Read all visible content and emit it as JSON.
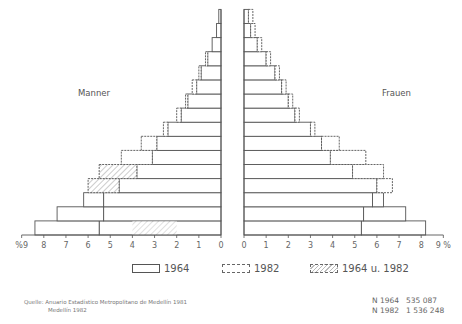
{
  "chart_data": {
    "type": "bar",
    "subtype": "population-pyramid",
    "title": "",
    "left_label": "Manner",
    "right_label": "Frauen",
    "xlabel": "%",
    "xlim": [
      0,
      9
    ],
    "x_ticks_left": [
      "%9",
      "8",
      "7",
      "6",
      "5",
      "4",
      "3",
      "2",
      "1",
      "0"
    ],
    "x_ticks_right": [
      "0",
      "1",
      "2",
      "3",
      "4",
      "5",
      "6",
      "7",
      "8",
      "9 %"
    ],
    "rows_bottom_to_top": 16,
    "series": [
      {
        "name": "1964 Manner",
        "side": "left",
        "values": [
          8.4,
          7.4,
          6.2,
          4.6,
          3.8,
          3.1,
          2.9,
          2.4,
          1.8,
          1.5,
          1.1,
          0.9,
          0.6,
          0.4,
          0.2,
          0.1
        ]
      },
      {
        "name": "1982 Manner",
        "side": "left",
        "values": [
          5.5,
          5.3,
          5.3,
          6.0,
          5.5,
          4.5,
          3.6,
          2.6,
          2.0,
          1.6,
          1.3,
          1.0,
          0.7,
          0.4,
          0.2,
          0.1
        ]
      },
      {
        "name": "1964 Frauen",
        "side": "right",
        "values": [
          8.2,
          7.3,
          6.3,
          6.0,
          4.9,
          3.9,
          3.5,
          3.0,
          2.3,
          2.0,
          1.7,
          1.4,
          1.0,
          0.6,
          0.3,
          0.2
        ]
      },
      {
        "name": "1982 Frauen",
        "side": "right",
        "values": [
          5.3,
          5.4,
          5.8,
          6.7,
          6.3,
          5.5,
          4.3,
          3.2,
          2.5,
          2.2,
          1.9,
          1.6,
          1.2,
          0.8,
          0.5,
          0.4
        ]
      }
    ],
    "legend": [
      "1964",
      "1982",
      "1964 u. 1982"
    ],
    "grid": false
  },
  "legend": {
    "item_1964": "1964",
    "item_1982": "1982",
    "item_both": "1964 u. 1982"
  },
  "labels": {
    "left": "Manner",
    "right": "Frauen"
  },
  "source": {
    "line1": "Quelle:  Anuario Estadístico Metropolitano de Medellín 1981",
    "line2": "Medellín 1982"
  },
  "totals": [
    {
      "label": "N 1964",
      "value": "535 087"
    },
    {
      "label": "N 1982",
      "value": "1 536 248"
    }
  ]
}
